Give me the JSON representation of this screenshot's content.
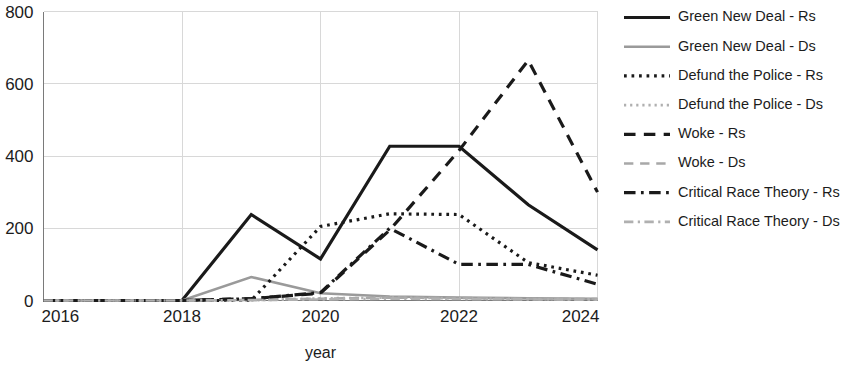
{
  "chart_data": {
    "type": "line",
    "title": "",
    "xlabel": "year",
    "ylabel": "",
    "x": [
      2016,
      2017,
      2018,
      2019,
      2020,
      2021,
      2022,
      2023,
      2024
    ],
    "xlim": [
      2016,
      2024
    ],
    "ylim": [
      0,
      800
    ],
    "xticks": [
      "2016",
      "2018",
      "2020",
      "2022",
      "2024"
    ],
    "xtick_values": [
      2016,
      2018,
      2020,
      2022,
      2024
    ],
    "yticks": [
      "0",
      "200",
      "400",
      "600",
      "800"
    ],
    "ytick_values": [
      0,
      200,
      400,
      600,
      800
    ],
    "grid": true,
    "legend_position": "right",
    "series": [
      {
        "name": "Green New Deal - Rs",
        "style": "solid",
        "color": "#1a1a1a",
        "width": 3.2,
        "values": [
          0,
          0,
          0,
          238,
          115,
          427,
          427,
          265,
          140
        ]
      },
      {
        "name": "Green New Deal - Ds",
        "style": "solid",
        "color": "#9a9a9a",
        "width": 2.6,
        "values": [
          0,
          0,
          0,
          65,
          20,
          11,
          8,
          6,
          5
        ]
      },
      {
        "name": "Defund the Police - Rs",
        "style": "dotted",
        "color": "#1a1a1a",
        "width": 3.2,
        "values": [
          0,
          0,
          0,
          0,
          205,
          240,
          238,
          105,
          70
        ]
      },
      {
        "name": "Defund the Police - Ds",
        "style": "dotted",
        "color": "#b0b0b0",
        "width": 2.6,
        "values": [
          0,
          0,
          0,
          0,
          6,
          8,
          6,
          4,
          3
        ]
      },
      {
        "name": "Woke - Rs",
        "style": "dashed",
        "color": "#1a1a1a",
        "width": 3.2,
        "values": [
          0,
          0,
          0,
          5,
          20,
          195,
          415,
          665,
          300
        ]
      },
      {
        "name": "Woke - Ds",
        "style": "dashed",
        "color": "#a8a8a8",
        "width": 2.6,
        "values": [
          0,
          0,
          0,
          2,
          5,
          8,
          7,
          5,
          4
        ]
      },
      {
        "name": "Critical Race Theory - Rs",
        "style": "dashdot",
        "color": "#1a1a1a",
        "width": 3.2,
        "values": [
          0,
          0,
          0,
          5,
          22,
          200,
          100,
          100,
          45
        ]
      },
      {
        "name": "Critical Race Theory - Ds",
        "style": "dashdot",
        "color": "#b0b0b0",
        "width": 2.6,
        "values": [
          0,
          0,
          0,
          1,
          3,
          5,
          4,
          3,
          2
        ]
      }
    ]
  },
  "axes": {
    "x_title": "year"
  },
  "legend": {
    "items": [
      {
        "label": "Green New Deal - Rs"
      },
      {
        "label": "Green New Deal - Ds"
      },
      {
        "label": "Defund the Police - Rs"
      },
      {
        "label": "Defund the Police - Ds"
      },
      {
        "label": "Woke - Rs"
      },
      {
        "label": "Woke - Ds"
      },
      {
        "label": "Critical Race Theory - Rs"
      },
      {
        "label": "Critical Race Theory - Ds"
      }
    ]
  }
}
